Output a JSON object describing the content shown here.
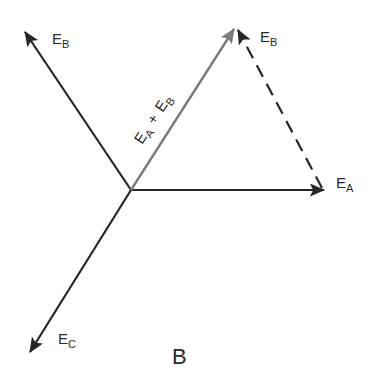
{
  "figure": {
    "caption": "B",
    "origin": {
      "x": 131,
      "y": 190
    },
    "colors": {
      "main_vector": "#262626",
      "resultant_vector": "#7a7a7a",
      "dashed_vector": "#262626",
      "text": "#2a2a2a"
    },
    "vectors": [
      {
        "id": "EA",
        "label_main": "E",
        "label_sub": "A",
        "x2": 324,
        "y2": 190,
        "style": "solid"
      },
      {
        "id": "EB",
        "label_main": "E",
        "label_sub": "B",
        "x2": 25,
        "y2": 32,
        "style": "solid"
      },
      {
        "id": "EC",
        "label_main": "E",
        "label_sub": "C",
        "x2": 30,
        "y2": 352,
        "style": "solid"
      },
      {
        "id": "EA_plus_EB",
        "label": "EA + EB",
        "x2": 234,
        "y2": 29,
        "style": "solid-gray"
      },
      {
        "id": "EB_translated",
        "label_main": "E",
        "label_sub": "B",
        "x1": 322,
        "y1": 188,
        "x2": 238,
        "y2": 30,
        "style": "dashed"
      }
    ],
    "labels": {
      "ea": {
        "main": "E",
        "sub": "A"
      },
      "eb_left": {
        "main": "E",
        "sub": "B"
      },
      "eb_right": {
        "main": "E",
        "sub": "B"
      },
      "ec": {
        "main": "E",
        "sub": "C"
      },
      "sum": {
        "a_main": "E",
        "a_sub": "A",
        "plus": "+",
        "b_main": "E",
        "b_sub": "B"
      }
    }
  }
}
